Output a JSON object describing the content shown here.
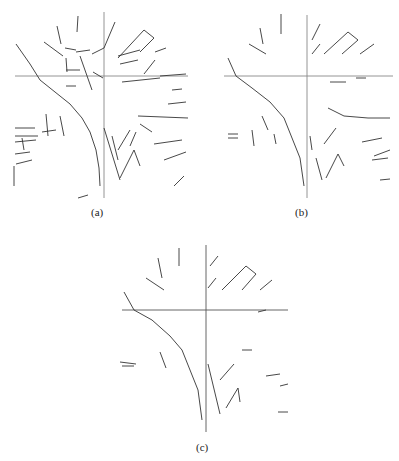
{
  "figure": {
    "panels": [
      {
        "id": "a",
        "caption": "(a)"
      },
      {
        "id": "b",
        "caption": "(b)"
      },
      {
        "id": "c",
        "caption": "(c)"
      }
    ],
    "line_color": "#333333",
    "axis_color": "#777777"
  }
}
